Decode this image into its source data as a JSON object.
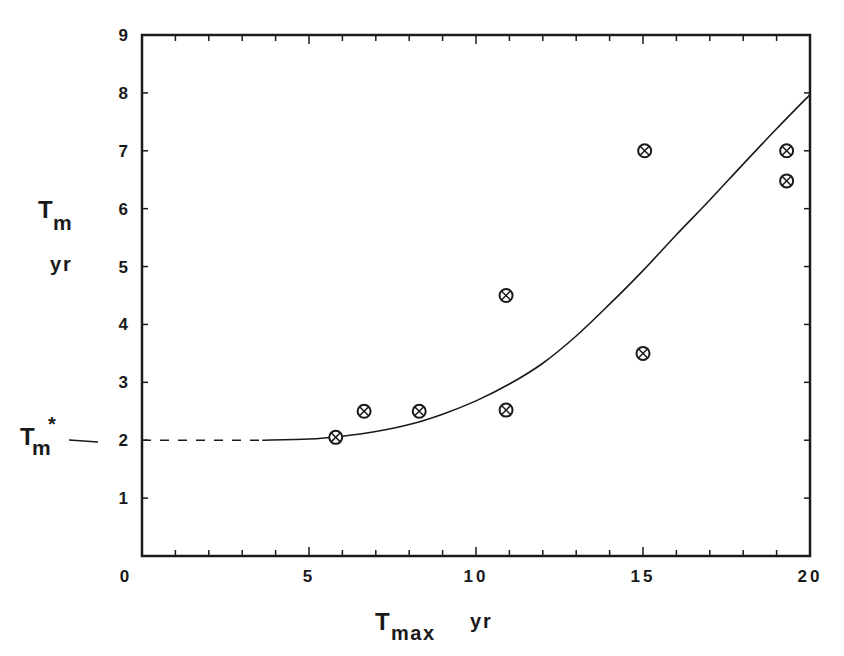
{
  "chart_data": {
    "type": "scatter",
    "title": "",
    "xlabel": "T_max yr",
    "ylabel": "T_m yr",
    "xlabel_parts": {
      "main": "T",
      "sub": "max",
      "unit": "yr"
    },
    "ylabel_parts": {
      "main": "T",
      "sub": "m",
      "unit": "yr"
    },
    "xlim": [
      0,
      20
    ],
    "ylim": [
      0,
      9
    ],
    "x_ticks": [
      0,
      5,
      10,
      15,
      20
    ],
    "x_tick_labels": [
      "0",
      "5",
      "10",
      "15",
      "20"
    ],
    "x_minor_step": 1,
    "y_ticks": [
      0,
      1,
      2,
      3,
      4,
      5,
      6,
      7,
      8,
      9
    ],
    "y_tick_labels": [
      "0",
      "1",
      "2",
      "3",
      "4",
      "5",
      "6",
      "7",
      "8",
      "9"
    ],
    "grid": false,
    "legend": null,
    "annotation": {
      "label_main": "T",
      "label_sub": "m",
      "label_sup": "*",
      "y": 2,
      "description": "asymptote marker at T_m* = 2"
    },
    "series": [
      {
        "name": "observations",
        "type": "scatter",
        "marker": "circled-x",
        "points": [
          {
            "x": 5.8,
            "y": 2.05
          },
          {
            "x": 6.65,
            "y": 2.5
          },
          {
            "x": 8.3,
            "y": 2.5
          },
          {
            "x": 10.9,
            "y": 4.5
          },
          {
            "x": 10.9,
            "y": 2.52
          },
          {
            "x": 15.05,
            "y": 7.0
          },
          {
            "x": 15.0,
            "y": 3.5
          },
          {
            "x": 19.3,
            "y": 7.0
          },
          {
            "x": 19.3,
            "y": 6.48
          }
        ]
      },
      {
        "name": "model curve (dashed extrapolation)",
        "type": "line",
        "style": "dashed",
        "points": [
          {
            "x": 0.0,
            "y": 2.0
          },
          {
            "x": 3.6,
            "y": 2.0
          }
        ]
      },
      {
        "name": "model curve",
        "type": "line",
        "style": "solid",
        "points": [
          {
            "x": 3.6,
            "y": 2.0
          },
          {
            "x": 5.0,
            "y": 2.02
          },
          {
            "x": 6.0,
            "y": 2.07
          },
          {
            "x": 7.0,
            "y": 2.15
          },
          {
            "x": 8.0,
            "y": 2.27
          },
          {
            "x": 9.0,
            "y": 2.45
          },
          {
            "x": 10.0,
            "y": 2.68
          },
          {
            "x": 11.0,
            "y": 2.97
          },
          {
            "x": 12.0,
            "y": 3.33
          },
          {
            "x": 13.0,
            "y": 3.8
          },
          {
            "x": 14.0,
            "y": 4.35
          },
          {
            "x": 15.0,
            "y": 4.93
          },
          {
            "x": 16.0,
            "y": 5.55
          },
          {
            "x": 17.0,
            "y": 6.15
          },
          {
            "x": 18.0,
            "y": 6.77
          },
          {
            "x": 19.0,
            "y": 7.38
          },
          {
            "x": 20.0,
            "y": 7.97
          }
        ]
      }
    ]
  },
  "colors": {
    "ink": "#1a1a1a",
    "background": "#ffffff"
  }
}
